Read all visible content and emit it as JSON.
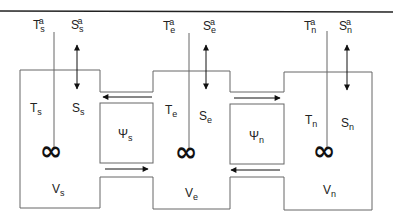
{
  "diagram": {
    "type": "three-box ocean model schematic",
    "colors": {
      "line": "#555555",
      "border": "#222222",
      "text": "#222222"
    },
    "boxes": [
      {
        "id": "s",
        "atmosphere": {
          "temperature": {
            "base": "T",
            "sub": "s",
            "sup": "a"
          },
          "salinity": {
            "base": "S",
            "sub": "s",
            "sup": "a"
          }
        },
        "temperature": {
          "base": "T",
          "sub": "s"
        },
        "salinity": {
          "base": "S",
          "sub": "s"
        },
        "volume": {
          "base": "V",
          "sub": "s"
        },
        "mixer_symbol": "∞"
      },
      {
        "id": "e",
        "atmosphere": {
          "temperature": {
            "base": "T",
            "sub": "e",
            "sup": "a"
          },
          "salinity": {
            "base": "S",
            "sub": "e",
            "sup": "a"
          }
        },
        "temperature": {
          "base": "T",
          "sub": "e"
        },
        "salinity": {
          "base": "S",
          "sub": "e"
        },
        "volume": {
          "base": "V",
          "sub": "e"
        },
        "mixer_symbol": "∞"
      },
      {
        "id": "n",
        "atmosphere": {
          "temperature": {
            "base": "T",
            "sub": "n",
            "sup": "a"
          },
          "salinity": {
            "base": "S",
            "sub": "n",
            "sup": "a"
          }
        },
        "temperature": {
          "base": "T",
          "sub": "n"
        },
        "salinity": {
          "base": "S",
          "sub": "n"
        },
        "volume": {
          "base": "V",
          "sub": "n"
        },
        "mixer_symbol": "∞"
      }
    ],
    "flows": [
      {
        "id": "psi-s",
        "base": "Ψ",
        "sub": "s",
        "upper_direction": "west",
        "lower_direction": "east"
      },
      {
        "id": "psi-n",
        "base": "Ψ",
        "sub": "n",
        "upper_direction": "east",
        "lower_direction": "west"
      }
    ]
  }
}
